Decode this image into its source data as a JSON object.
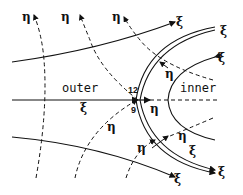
{
  "diagram": {
    "regions": {
      "outer": "outer",
      "inner": "inner"
    },
    "numbers": {
      "top": "12",
      "bottom": "9"
    },
    "eta": "η",
    "xi": "ξ"
  }
}
